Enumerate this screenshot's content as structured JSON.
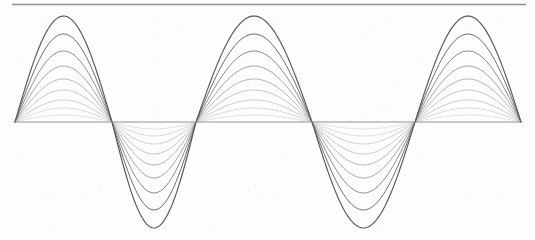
{
  "figure": {
    "name": "standing-wave-harmonic-envelope",
    "title": "",
    "width": 535,
    "height": 240,
    "background_color": "#fdfdfb"
  },
  "axis": {
    "name": "horizontal-equilibrium-axis",
    "y": 122,
    "x_start": 15,
    "x_end": 521,
    "color": "#8f9194",
    "stroke_width": 1.1
  },
  "top_rule": {
    "name": "top-horizontal-rule",
    "y": 4.5,
    "x_start": 12,
    "x_end": 526,
    "color": "#8c8e91",
    "stroke_width": 1.6
  },
  "chart_data": {
    "type": "line",
    "title": "",
    "subtitle": "",
    "xlabel": "",
    "ylabel": "",
    "xlim": [
      15,
      521
    ],
    "ylim": [
      -106,
      106
    ],
    "grid": false,
    "legend": false,
    "legend_position": "none",
    "annotations": [],
    "x_tick_labels": [],
    "y_tick_labels": [],
    "axis_y_pixel": 122,
    "wave": {
      "node_positions_px": [
        15,
        112,
        196,
        312,
        415,
        521
      ],
      "antinode_positions_px": [
        78,
        154,
        254,
        364,
        468
      ],
      "antinode_signs": [
        1,
        -1,
        1,
        -1,
        1
      ],
      "half_wavelengths": 5,
      "max_amplitude_px": 106,
      "phase_offset": 0
    },
    "series": [
      {
        "name": "trace-1",
        "amplitude_px": 106,
        "amplitude_fraction": 1.0,
        "color": "#555759",
        "stroke_width": 1.15
      },
      {
        "name": "trace-2",
        "amplitude_px": 88,
        "amplitude_fraction": 0.83,
        "color": "#6c6e70",
        "stroke_width": 1.0
      },
      {
        "name": "trace-3",
        "amplitude_px": 71,
        "amplitude_fraction": 0.67,
        "color": "#84868a",
        "stroke_width": 0.95
      },
      {
        "name": "trace-4",
        "amplitude_px": 56,
        "amplitude_fraction": 0.53,
        "color": "#9a9ca0",
        "stroke_width": 0.9
      },
      {
        "name": "trace-5",
        "amplitude_px": 43,
        "amplitude_fraction": 0.41,
        "color": "#adafb3",
        "stroke_width": 0.9
      },
      {
        "name": "trace-6",
        "amplitude_px": 32,
        "amplitude_fraction": 0.3,
        "color": "#bdbfc2",
        "stroke_width": 0.85
      },
      {
        "name": "trace-7",
        "amplitude_px": 22,
        "amplitude_fraction": 0.21,
        "color": "#c6c8cb",
        "stroke_width": 0.85
      },
      {
        "name": "trace-8",
        "amplitude_px": 14,
        "amplitude_fraction": 0.13,
        "color": "#cfd1d4",
        "stroke_width": 0.8
      },
      {
        "name": "trace-9",
        "amplitude_px": 7,
        "amplitude_fraction": 0.07,
        "color": "#d8dadd",
        "stroke_width": 0.8
      }
    ]
  }
}
